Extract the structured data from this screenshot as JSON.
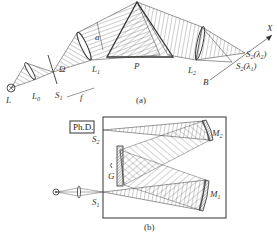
{
  "figure": {
    "panel_a": {
      "caption": "(a)",
      "labels": {
        "source": "L",
        "lens0": "L",
        "lens0_sub": "0",
        "slit1": "S",
        "slit1_sub": "1",
        "solid_angle": "Ω",
        "lens1": "L",
        "lens1_sub": "1",
        "aperture": "a",
        "focal": "f",
        "prism": "P",
        "lens2": "L",
        "lens2_sub": "2",
        "axis_x": "X",
        "axis_b": "B",
        "image2": "S",
        "image2_sub": "2",
        "image2_arg": "(λ",
        "image2_arg_sub": "2",
        "image1": "S",
        "image1_sub": "2",
        "image1_arg": "(λ",
        "image1_arg_sub": "1"
      }
    },
    "panel_b": {
      "caption": "(b)",
      "labels": {
        "detector": "Ph.D.",
        "slit2": "S",
        "slit2_sub": "2",
        "grating": "G",
        "mirror2": "M",
        "mirror2_sub": "2",
        "mirror1": "M",
        "mirror1_sub": "1",
        "slit1": "S",
        "slit1_sub": "1"
      }
    },
    "colors": {
      "ink": "#333333",
      "hatch": "#555555"
    }
  }
}
